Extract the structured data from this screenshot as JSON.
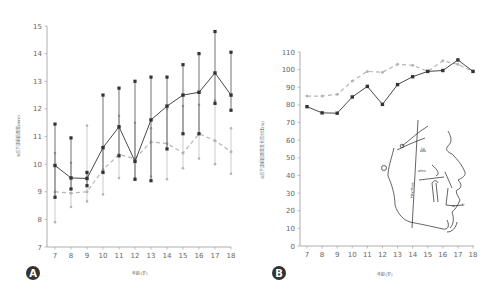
{
  "chart_data": [
    {
      "panel": "A",
      "type": "line",
      "title": "",
      "xlabel": "年龄(岁)",
      "ylabel": "B点下颌前后距离(mm)",
      "x": [
        7,
        8,
        9,
        10,
        11,
        12,
        13,
        14,
        15,
        16,
        17,
        18
      ],
      "xlim": [
        7,
        18
      ],
      "ylim": [
        7,
        15
      ],
      "yticks": [
        7,
        8,
        9,
        10,
        11,
        12,
        13,
        14,
        15
      ],
      "grid": false,
      "series": [
        {
          "name": "series-1 (solid, black)",
          "style": "solid",
          "color": "#333333",
          "values": [
            9.95,
            9.5,
            9.48,
            10.6,
            11.35,
            10.1,
            11.6,
            12.1,
            12.5,
            12.6,
            13.3,
            12.5
          ],
          "upper": [
            11.45,
            10.95,
            9.7,
            12.5,
            12.75,
            13.0,
            13.15,
            13.15,
            13.6,
            14.0,
            14.8,
            14.05
          ],
          "lower": [
            8.8,
            9.1,
            9.22,
            9.7,
            10.3,
            9.45,
            9.4,
            10.55,
            11.1,
            11.1,
            12.2,
            11.95
          ]
        },
        {
          "name": "series-2 (dashed, gray)",
          "style": "dashed",
          "color": "#b5b5b5",
          "values": [
            9.0,
            8.95,
            9.0,
            9.8,
            10.35,
            10.2,
            10.8,
            10.75,
            10.4,
            11.1,
            10.85,
            10.45
          ],
          "upper": [
            10.4,
            10.05,
            11.4,
            10.55,
            11.75,
            11.5,
            11.3,
            12.0,
            12.1,
            12.15,
            12.3,
            11.3
          ],
          "lower": [
            7.9,
            8.45,
            8.65,
            8.9,
            9.5,
            9.5,
            9.55,
            9.45,
            9.85,
            10.2,
            10.0,
            9.65
          ]
        }
      ]
    },
    {
      "panel": "B",
      "type": "line",
      "title": "",
      "xlabel": "年龄(岁)",
      "ylabel": "B点下颌前后距离生长百分比(%)",
      "x": [
        7,
        8,
        9,
        10,
        11,
        12,
        13,
        14,
        15,
        16,
        17,
        18
      ],
      "xlim": [
        7,
        18
      ],
      "ylim": [
        0,
        110
      ],
      "yticks": [
        0,
        10,
        20,
        30,
        40,
        50,
        60,
        70,
        80,
        90,
        100,
        110
      ],
      "grid": false,
      "series": [
        {
          "name": "series-1 (solid, black)",
          "style": "solid",
          "color": "#333333",
          "values": [
            79,
            75.5,
            75.3,
            84.5,
            90.5,
            80.3,
            91.5,
            96,
            99,
            99.5,
            105.5,
            99
          ]
        },
        {
          "name": "series-2 (dashed, gray)",
          "style": "dashed",
          "color": "#b5b5b5",
          "values": [
            85,
            85,
            86,
            93.5,
            99,
            98.5,
            103,
            102.5,
            99,
            105,
            103,
            99
          ]
        }
      ],
      "annotations": [
        "PMV Plane",
        "Ptm",
        "Se",
        "Or",
        "B'"
      ]
    }
  ],
  "panels": {
    "a": {
      "badge": "A",
      "xlabel": "年龄(岁)",
      "ylabel": "B点下颌前后距离(mm)"
    },
    "b": {
      "badge": "B",
      "xlabel": "年龄(岁)",
      "ylabel": "B点下颌前后距离生长百分比(%)"
    }
  },
  "diagram": {
    "labels": {
      "plane": "PMV Plane",
      "ptm": "Ptm",
      "se": "Se",
      "or": "Or",
      "b": "B'"
    }
  },
  "colors": {
    "solid": "#333333",
    "dashed": "#b5b5b5",
    "axis": "#999999",
    "badge": "#333333"
  }
}
